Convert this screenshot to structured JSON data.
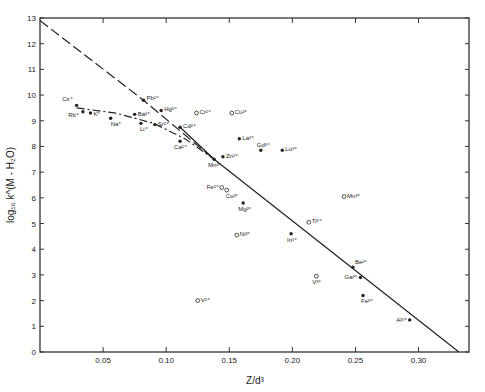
{
  "chart_data": {
    "type": "scatter",
    "title": "",
    "xlabel": "Z/d³",
    "ylabel": "log₁₀ k^(M - H₂O)",
    "xlim": [
      0,
      0.34
    ],
    "ylim": [
      0,
      13
    ],
    "grid": false,
    "legend": "none",
    "x_ticks": [
      {
        "value": 0.05,
        "label": "0.05"
      },
      {
        "value": 0.1,
        "label": "0.10"
      },
      {
        "value": 0.15,
        "label": "0.15"
      },
      {
        "value": 0.2,
        "label": "0.20"
      },
      {
        "value": 0.25,
        "label": "0.25"
      },
      {
        "value": 0.3,
        "label": "0.30"
      }
    ],
    "y_ticks": [
      {
        "value": 0,
        "label": "0"
      },
      {
        "value": 1,
        "label": "1"
      },
      {
        "value": 2,
        "label": "2"
      },
      {
        "value": 3,
        "label": "3"
      },
      {
        "value": 4,
        "label": "4"
      },
      {
        "value": 5,
        "label": "5"
      },
      {
        "value": 6,
        "label": "6"
      },
      {
        "value": 7,
        "label": "7"
      },
      {
        "value": 8,
        "label": "8"
      },
      {
        "value": 9,
        "label": "9"
      },
      {
        "value": 10,
        "label": "10"
      },
      {
        "value": 11,
        "label": "11"
      },
      {
        "value": 12,
        "label": "12"
      },
      {
        "value": 13,
        "label": "13"
      }
    ],
    "series": [
      {
        "name": "filled points",
        "marker": "filled-circle",
        "points": [
          {
            "label": "Cs⁺",
            "x": 0.029,
            "y": 9.6,
            "dx": -4,
            "dy": -4,
            "anchor": "end"
          },
          {
            "label": "Rb⁺",
            "x": 0.034,
            "y": 9.35,
            "dx": -4,
            "dy": 5,
            "anchor": "end"
          },
          {
            "label": "K⁺",
            "x": 0.04,
            "y": 9.3,
            "dx": 3,
            "dy": 3,
            "anchor": "start"
          },
          {
            "label": "Na⁺",
            "x": 0.056,
            "y": 9.1,
            "dx": 0,
            "dy": 8,
            "anchor": "start"
          },
          {
            "label": "Pb²⁺",
            "x": 0.082,
            "y": 9.8,
            "dx": 3,
            "dy": 0,
            "anchor": "start"
          },
          {
            "label": "Ba²⁺",
            "x": 0.075,
            "y": 9.25,
            "dx": 3,
            "dy": 2,
            "anchor": "start"
          },
          {
            "label": "Li⁺",
            "x": 0.08,
            "y": 8.9,
            "dx": -1,
            "dy": 8,
            "anchor": "start"
          },
          {
            "label": "Hg²⁺",
            "x": 0.096,
            "y": 9.4,
            "dx": 3,
            "dy": 1,
            "anchor": "start"
          },
          {
            "label": "Sr²⁺",
            "x": 0.091,
            "y": 8.85,
            "dx": 3,
            "dy": 1,
            "anchor": "start"
          },
          {
            "label": "Cd²⁺",
            "x": 0.111,
            "y": 8.75,
            "dx": 3,
            "dy": 1,
            "anchor": "start"
          },
          {
            "label": "Ca²⁺",
            "x": 0.111,
            "y": 8.2,
            "dx": -6,
            "dy": 8,
            "anchor": "start"
          },
          {
            "label": "Mn²⁺",
            "x": 0.138,
            "y": 7.5,
            "dx": -6,
            "dy": 8,
            "anchor": "start"
          },
          {
            "label": "Zn²⁺",
            "x": 0.145,
            "y": 7.6,
            "dx": 3,
            "dy": 1,
            "anchor": "start"
          },
          {
            "label": "La³⁺",
            "x": 0.158,
            "y": 8.3,
            "dx": 3,
            "dy": 1,
            "anchor": "start"
          },
          {
            "label": "Gd³⁺",
            "x": 0.175,
            "y": 7.85,
            "dx": -4,
            "dy": -3,
            "anchor": "start"
          },
          {
            "label": "Lu³⁺",
            "x": 0.192,
            "y": 7.85,
            "dx": 3,
            "dy": 1,
            "anchor": "start"
          },
          {
            "label": "Mg²⁺",
            "x": 0.161,
            "y": 5.8,
            "dx": -5,
            "dy": 8,
            "anchor": "start"
          },
          {
            "label": "In³⁺",
            "x": 0.199,
            "y": 4.6,
            "dx": -4,
            "dy": 8,
            "anchor": "start"
          },
          {
            "label": "Be²⁺",
            "x": 0.248,
            "y": 3.3,
            "dx": 2,
            "dy": -3,
            "anchor": "start"
          },
          {
            "label": "Ga³⁺",
            "x": 0.254,
            "y": 2.9,
            "dx": -3,
            "dy": 2,
            "anchor": "end"
          },
          {
            "label": "Fe³⁺",
            "x": 0.256,
            "y": 2.2,
            "dx": -2,
            "dy": 8,
            "anchor": "start"
          },
          {
            "label": "Al³⁺",
            "x": 0.293,
            "y": 1.25,
            "dx": -3,
            "dy": 2,
            "anchor": "end"
          }
        ]
      },
      {
        "name": "open points",
        "marker": "open-circle",
        "points": [
          {
            "label": "Cr²⁺",
            "x": 0.124,
            "y": 9.3,
            "dx": 3,
            "dy": 1,
            "anchor": "start"
          },
          {
            "label": "Cu²⁺",
            "x": 0.152,
            "y": 9.3,
            "dx": 3,
            "dy": 1,
            "anchor": "start"
          },
          {
            "label": "Fe²⁺",
            "x": 0.144,
            "y": 6.4,
            "dx": -3,
            "dy": 1,
            "anchor": "end"
          },
          {
            "label": "Co²⁺",
            "x": 0.148,
            "y": 6.3,
            "dx": -1,
            "dy": 8,
            "anchor": "start"
          },
          {
            "label": "Ni²⁺",
            "x": 0.156,
            "y": 4.55,
            "dx": 3,
            "dy": 1,
            "anchor": "start"
          },
          {
            "label": "Ti³⁺",
            "x": 0.213,
            "y": 5.05,
            "dx": 3,
            "dy": 1,
            "anchor": "start"
          },
          {
            "label": "Mn³⁺",
            "x": 0.241,
            "y": 6.05,
            "dx": 3,
            "dy": 1,
            "anchor": "start"
          },
          {
            "label": "V³⁺",
            "x": 0.219,
            "y": 2.95,
            "dx": -4,
            "dy": 8,
            "anchor": "start"
          },
          {
            "label": "V²⁺",
            "x": 0.125,
            "y": 2.0,
            "dx": 3,
            "dy": 1,
            "anchor": "start"
          }
        ]
      }
    ],
    "lines": [
      {
        "name": "solid fit line",
        "style": "solid",
        "points": [
          [
            0.111,
            8.75
          ],
          [
            0.138,
            7.5
          ],
          [
            0.332,
            0.0
          ]
        ]
      },
      {
        "name": "long-dashed line",
        "style": "dashed",
        "points": [
          [
            0.0,
            12.9
          ],
          [
            0.082,
            9.8
          ],
          [
            0.138,
            7.5
          ]
        ]
      },
      {
        "name": "short-dashed curve",
        "style": "dash-dot",
        "points": [
          [
            0.029,
            9.5
          ],
          [
            0.06,
            9.3
          ],
          [
            0.09,
            8.9
          ],
          [
            0.115,
            8.3
          ],
          [
            0.138,
            7.5
          ]
        ]
      }
    ]
  }
}
